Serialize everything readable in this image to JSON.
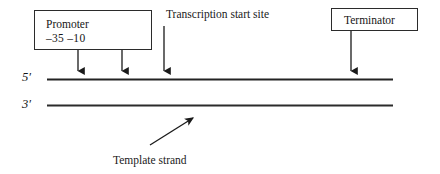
{
  "diagram": {
    "background_color": "#ffffff",
    "line_color": "#2b2b2b",
    "boxes": {
      "promoter": {
        "label": "Promoter",
        "sites": "–35 –10",
        "name": "promoter-box"
      },
      "terminator": {
        "label": "Terminator",
        "name": "terminator-box"
      }
    },
    "annotations": {
      "transcription_start_site": "Transcription start site",
      "template_strand": "Template strand"
    },
    "strands": {
      "top_label": "5′",
      "bottom_label": "3′"
    },
    "arrows": {
      "minus35_x": 78,
      "minus10_x": 122,
      "start_site_x": 164,
      "terminator_x": 351,
      "template_from": [
        150,
        145
      ],
      "template_to": [
        196,
        116
      ]
    }
  }
}
